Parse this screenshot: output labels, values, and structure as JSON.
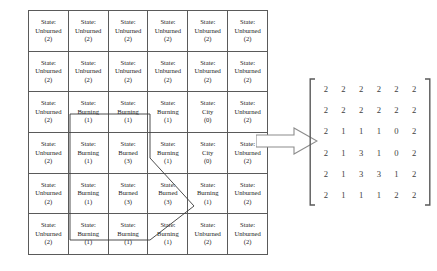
{
  "diagram": {
    "state_label_prefix": "State:",
    "legend": {
      "unburned": {
        "name": "Unburned",
        "code": "2"
      },
      "burning": {
        "name": "Burning",
        "code": "1"
      },
      "burned": {
        "name": "Burned",
        "code": "3"
      },
      "city": {
        "name": "City",
        "code": "0"
      }
    },
    "colors": {
      "grid_line": "#5a5a5a",
      "text": "#1b1b1b",
      "matrix_text": "#404040",
      "arrow_outline": "#8c8c8c",
      "annotation_line": "#3a3a3a"
    },
    "arrow": {
      "name": "block-arrow-right",
      "direction": "right"
    },
    "grid": {
      "rows": 6,
      "cols": 6,
      "cells": [
        [
          {
            "state": "Unburned",
            "code": "(2)"
          },
          {
            "state": "Unburned",
            "code": "(2)"
          },
          {
            "state": "Unburned",
            "code": "(2)"
          },
          {
            "state": "Unburned",
            "code": "(2)"
          },
          {
            "state": "Unburned",
            "code": "(2)"
          },
          {
            "state": "Unburned",
            "code": "(2)"
          }
        ],
        [
          {
            "state": "Unburned",
            "code": "(2)"
          },
          {
            "state": "Unburned",
            "code": "(2)"
          },
          {
            "state": "Unburned",
            "code": "(2)"
          },
          {
            "state": "Unburned",
            "code": "(2)"
          },
          {
            "state": "Unburned",
            "code": "(2)"
          },
          {
            "state": "Unburned",
            "code": "(2)"
          }
        ],
        [
          {
            "state": "Unburned",
            "code": "(2)"
          },
          {
            "state": "Burning",
            "code": "(1)"
          },
          {
            "state": "Burning",
            "code": "(1)"
          },
          {
            "state": "Burning",
            "code": "(1)"
          },
          {
            "state": "City",
            "code": "(0)"
          },
          {
            "state": "Unburned",
            "code": "(2)"
          }
        ],
        [
          {
            "state": "Unburned",
            "code": "(2)"
          },
          {
            "state": "Burning",
            "code": "(1)"
          },
          {
            "state": "Burned",
            "code": "(3)"
          },
          {
            "state": "Burning",
            "code": "(1)"
          },
          {
            "state": "City",
            "code": "(0)"
          },
          {
            "state": "Unburned",
            "code": "(2)"
          }
        ],
        [
          {
            "state": "Unburned",
            "code": "(2)"
          },
          {
            "state": "Burning",
            "code": "(1)"
          },
          {
            "state": "Burned",
            "code": "(3)"
          },
          {
            "state": "Burned",
            "code": "(3)"
          },
          {
            "state": "Burning",
            "code": "(1)"
          },
          {
            "state": "Unburned",
            "code": "(2)"
          }
        ],
        [
          {
            "state": "Unburned",
            "code": "(2)"
          },
          {
            "state": "Burning",
            "code": "(1)"
          },
          {
            "state": "Burning",
            "code": "(1)"
          },
          {
            "state": "Burning",
            "code": "(1)"
          },
          {
            "state": "Unburned",
            "code": "(2)"
          },
          {
            "state": "Unburned",
            "code": "(2)"
          }
        ]
      ]
    },
    "matrix": {
      "rows": 6,
      "cols": 6,
      "values": [
        [
          "2",
          "2",
          "2",
          "2",
          "2",
          "2"
        ],
        [
          "2",
          "2",
          "2",
          "2",
          "2",
          "2"
        ],
        [
          "2",
          "1",
          "1",
          "1",
          "0",
          "2"
        ],
        [
          "2",
          "1",
          "3",
          "1",
          "0",
          "2"
        ],
        [
          "2",
          "1",
          "3",
          "3",
          "1",
          "2"
        ],
        [
          "2",
          "1",
          "1",
          "1",
          "2",
          "2"
        ]
      ]
    }
  }
}
